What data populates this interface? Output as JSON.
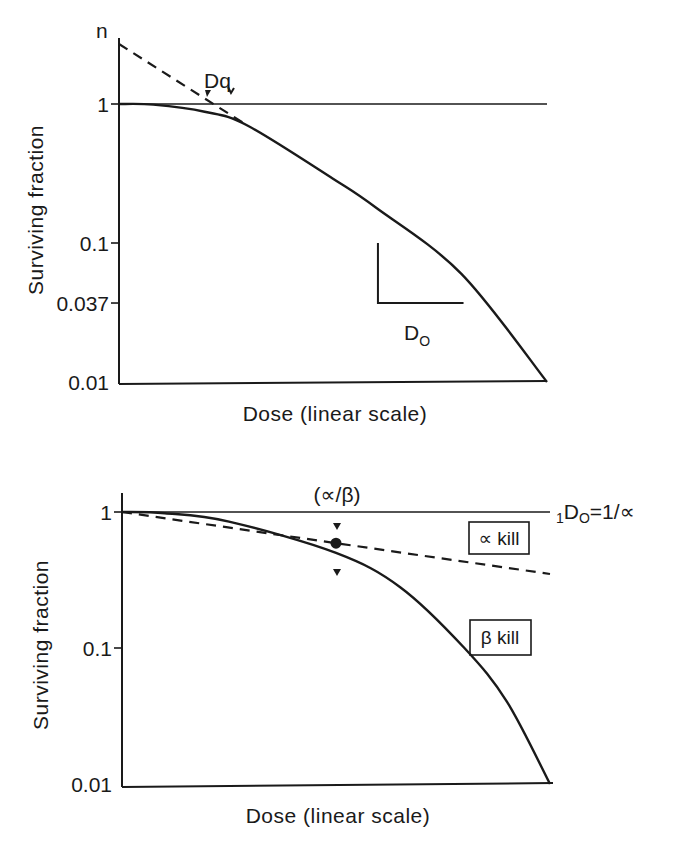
{
  "chart_data": [
    {
      "type": "line",
      "title": "",
      "xlabel": "Dose (linear scale)",
      "ylabel": "Surviving fraction",
      "yscale": "log",
      "ylim": [
        0.01,
        1
      ],
      "y_ticks": [
        {
          "value": 1,
          "label": "1"
        },
        {
          "value": 0.1,
          "label": "0.1"
        },
        {
          "value": 0.037,
          "label": "0.037"
        },
        {
          "value": 0.01,
          "label": "0.01"
        }
      ],
      "x_ticks": [],
      "grid": false,
      "annotations": {
        "extrapolation_number": "n",
        "quasi_threshold_dose": "Dq",
        "d0_label_main": "D",
        "d0_label_sub": "O"
      },
      "series": [
        {
          "name": "survival-curve",
          "style": "solid",
          "points": [
            [
              0,
              1
            ],
            [
              0.08,
              0.99
            ],
            [
              0.2,
              0.88
            ],
            [
              0.3,
              0.7
            ],
            [
              0.5,
              0.29
            ],
            [
              0.6,
              0.18
            ],
            [
              0.8,
              0.06
            ],
            [
              1.0,
              0.01
            ]
          ]
        },
        {
          "name": "extrapolation-line",
          "style": "dashed",
          "points": [
            [
              0,
              2.7
            ],
            [
              0.3,
              0.7
            ]
          ]
        },
        {
          "name": "reference-line-sf-1",
          "style": "solid-thin",
          "points": [
            [
              0,
              1
            ],
            [
              1.0,
              1
            ]
          ]
        }
      ],
      "d0_triangle": {
        "x_start": 0.605,
        "x_end": 0.805,
        "y_top": 0.1,
        "y_bottom": 0.037
      }
    },
    {
      "type": "line",
      "title": "",
      "xlabel": "Dose (linear scale)",
      "ylabel": "Surviving fraction",
      "yscale": "log",
      "ylim": [
        0.01,
        1
      ],
      "y_ticks": [
        {
          "value": 1,
          "label": "1"
        },
        {
          "value": 0.1,
          "label": "0.1"
        },
        {
          "value": 0.01,
          "label": "0.01"
        }
      ],
      "x_ticks": [],
      "grid": false,
      "annotations": {
        "alpha_beta": "(∝/β)",
        "d0_prefix": "1",
        "d0_main": "D",
        "d0_sub": "O",
        "d0_eq": "=1/∝",
        "alpha_kill": "∝ kill",
        "beta_kill": "β kill"
      },
      "series": [
        {
          "name": "linear-quadratic-curve",
          "style": "solid",
          "points": [
            [
              0,
              1
            ],
            [
              0.1,
              0.98
            ],
            [
              0.25,
              0.85
            ],
            [
              0.5,
              0.5
            ],
            [
              0.65,
              0.28
            ],
            [
              0.8,
              0.1
            ],
            [
              0.9,
              0.04
            ],
            [
              1.0,
              0.01
            ]
          ]
        },
        {
          "name": "alpha-kill-line",
          "style": "dashed",
          "points": [
            [
              0,
              1
            ],
            [
              0.5,
              0.59
            ],
            [
              1.0,
              0.35
            ]
          ]
        },
        {
          "name": "reference-line-sf-1",
          "style": "solid-thin",
          "points": [
            [
              0,
              1
            ],
            [
              1.0,
              1
            ]
          ]
        }
      ],
      "alpha_beta_point": {
        "x": 0.5,
        "y": 0.59
      }
    }
  ]
}
